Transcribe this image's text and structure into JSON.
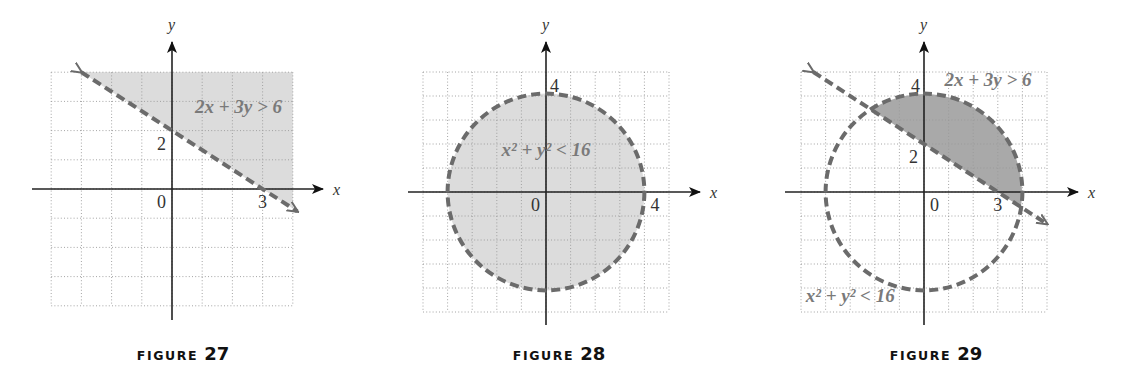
{
  "chart_data": [
    {
      "type": "region",
      "caption_word": "FIGURE",
      "caption_number": "27",
      "xlabel": "x",
      "ylabel": "y",
      "xlim": [
        -4,
        4
      ],
      "ylim": [
        -4,
        4
      ],
      "grid": true,
      "curves": [
        {
          "kind": "line",
          "equation": "2x + 3y = 6",
          "a": 2,
          "b": 3,
          "c": 6,
          "style": "dashed",
          "arrows": true,
          "x_range": [
            -3,
            4.15
          ]
        }
      ],
      "shaded_region": "2x + 3y > 6",
      "shade_color": "#dcdcdc",
      "line_color": "#6b6b6b",
      "annotations": [
        {
          "text": "2x + 3y > 6",
          "x": 2.2,
          "y": 2.6
        }
      ],
      "tick_labels": [
        {
          "text": "0",
          "x": 0,
          "y": 0,
          "pos": "below-left"
        },
        {
          "text": "2",
          "x": 0,
          "y": 2,
          "pos": "below-left"
        },
        {
          "text": "3",
          "x": 3,
          "y": 0,
          "pos": "below"
        }
      ]
    },
    {
      "type": "region",
      "caption_word": "FIGURE",
      "caption_number": "28",
      "xlabel": "x",
      "ylabel": "y",
      "xlim": [
        -5,
        5
      ],
      "ylim": [
        -5,
        5
      ],
      "grid": true,
      "curves": [
        {
          "kind": "circle",
          "equation": "x^2 + y^2 = 16",
          "r": 4,
          "style": "dashed"
        }
      ],
      "shaded_region": "x^2 + y^2 < 16",
      "shade_color": "#dcdcdc",
      "line_color": "#6b6b6b",
      "annotations": [
        {
          "text": "x² + y² < 16",
          "x": 0,
          "y": 1.5
        }
      ],
      "tick_labels": [
        {
          "text": "0",
          "x": 0,
          "y": 0,
          "pos": "below-left"
        },
        {
          "text": "4",
          "x": 0,
          "y": 4,
          "pos": "above-right"
        },
        {
          "text": "4",
          "x": 4,
          "y": 0,
          "pos": "below-right"
        }
      ]
    },
    {
      "type": "region",
      "caption_word": "FIGURE",
      "caption_number": "29",
      "xlabel": "x",
      "ylabel": "y",
      "xlim": [
        -5,
        5
      ],
      "ylim": [
        -5,
        5
      ],
      "grid": true,
      "curves": [
        {
          "kind": "line",
          "equation": "2x + 3y = 6",
          "a": 2,
          "b": 3,
          "c": 6,
          "style": "dashed",
          "arrows": true,
          "x_range": [
            -4.5,
            5
          ]
        },
        {
          "kind": "circle",
          "equation": "x^2 + y^2 = 16",
          "r": 4,
          "style": "dashed"
        }
      ],
      "shaded_region": "2x + 3y > 6 and x^2 + y^2 < 16",
      "shade_color": "#a9a9a9",
      "line_color": "#6b6b6b",
      "annotations": [
        {
          "text": "2x + 3y > 6",
          "x": 2.6,
          "y": 4.4
        },
        {
          "text": "x² + y² < 16",
          "x": -3,
          "y": -4.6
        }
      ],
      "tick_labels": [
        {
          "text": "0",
          "x": 0,
          "y": 0,
          "pos": "below-right"
        },
        {
          "text": "2",
          "x": 0,
          "y": 2,
          "pos": "below-left"
        },
        {
          "text": "3",
          "x": 3,
          "y": 0,
          "pos": "below"
        },
        {
          "text": "4",
          "x": 0,
          "y": 4,
          "pos": "above-left"
        }
      ]
    }
  ]
}
